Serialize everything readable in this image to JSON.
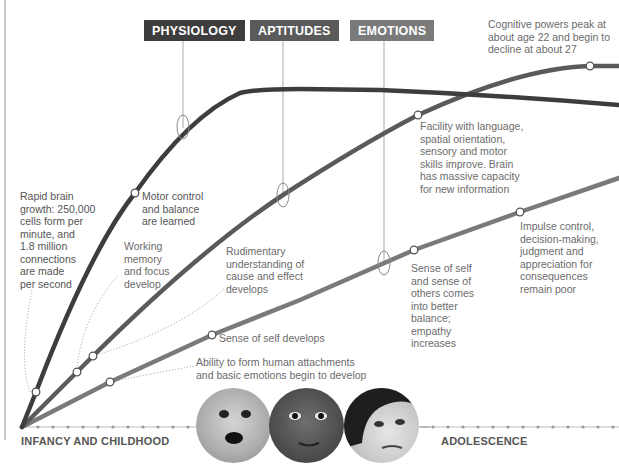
{
  "categories": {
    "physiology": {
      "label": "PHYSIOLOGY",
      "color": "#3d3d3d"
    },
    "aptitudes": {
      "label": "APTITUDES",
      "color": "#5a5a5a"
    },
    "emotions": {
      "label": "EMOTIONS",
      "color": "#7a7a7a"
    }
  },
  "annotations": {
    "cognitive_peak": "Cognitive powers peak at\nabout age 22 and begin to\ndecline at about 27",
    "rapid_growth": "Rapid brain\ngrowth: 250,000\ncells form per\nminute, and\n1.8 million\nconnections\nare made\nper second",
    "motor_control": "Motor control\nand balance\nare learned",
    "working_memory": "Working\nmemory\nand focus\ndevelop",
    "rudimentary": "Rudimentary\nunderstanding of\ncause and effect\ndevelops",
    "sense_of_self": "Sense of self develops",
    "attachments": "Ability to form human attachments\nand basic emotions begin to develop",
    "facility_language": "Facility with language,\nspatial orientation,\nsensory and motor\nskills improve. Brain\nhas massive capacity\nfor new information",
    "sense_self_others": "Sense of self\nand sense of\nothers comes\ninto better\nbalance;\nempathy\nincreases",
    "impulse_control": "Impulse control,\ndecision-making,\njudgment and\nappreciation for\nconsequences\nremain poor"
  },
  "stages": {
    "infancy": "INFANCY AND CHILDHOOD",
    "adolescence": "ADOLESCENCE"
  },
  "photos": [
    {
      "name": "infant-face",
      "description": "baby with open mouth"
    },
    {
      "name": "child-face",
      "description": "child face"
    },
    {
      "name": "adolescent-face",
      "description": "teen with dark curly hair"
    }
  ]
}
